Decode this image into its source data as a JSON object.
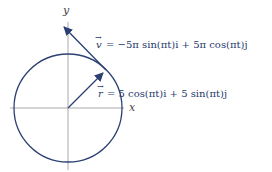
{
  "diagram": {
    "axes": {
      "x_label": "x",
      "y_label": "y"
    },
    "velocity": {
      "symbol": "v",
      "equation": "= −5π sin(πt)i + 5π cos(πt)j"
    },
    "position": {
      "symbol": "r",
      "equation": "= 5 cos(πt)i + 5 sin(πt)j"
    },
    "colors": {
      "curve": "#2b3f73",
      "axis": "#aaaaaa",
      "text": "#1f3a6e"
    }
  }
}
